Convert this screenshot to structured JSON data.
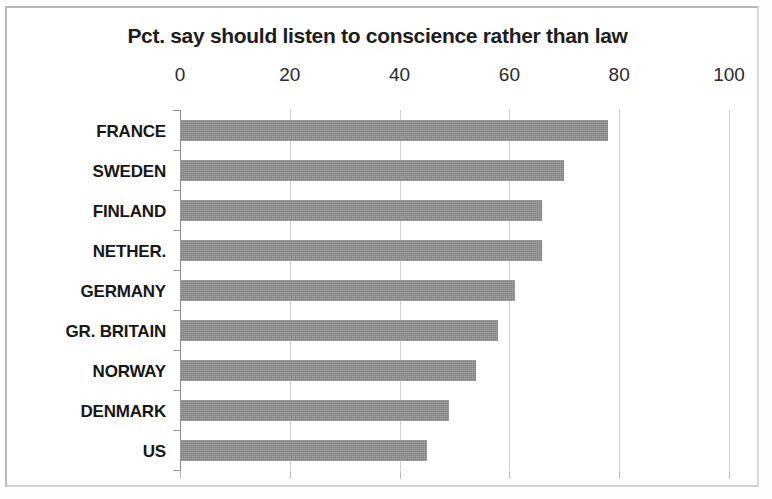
{
  "chart_data": {
    "type": "bar",
    "orientation": "horizontal",
    "title": "Pct. say should listen to conscience rather than law",
    "xlabel": "",
    "ylabel": "",
    "categories": [
      "FRANCE",
      "SWEDEN",
      "FINLAND",
      "NETHER.",
      "GERMANY",
      "GR. BRITAIN",
      "NORWAY",
      "DENMARK",
      "US"
    ],
    "values": [
      78,
      70,
      66,
      66,
      61,
      58,
      54,
      49,
      45
    ],
    "xlim": [
      0,
      100
    ],
    "x_ticks": [
      0,
      20,
      40,
      60,
      80,
      100
    ],
    "x_tick_labels": [
      "0",
      "20",
      "40",
      "60",
      "80",
      "100"
    ],
    "grid": "vertical",
    "legend": null,
    "bar_color": "#8e8e8e",
    "axis_color": "#8d8d8d",
    "gridline_color": "#cfcfcf",
    "title_color": "#1d1d1d",
    "label_color": "#171717"
  }
}
